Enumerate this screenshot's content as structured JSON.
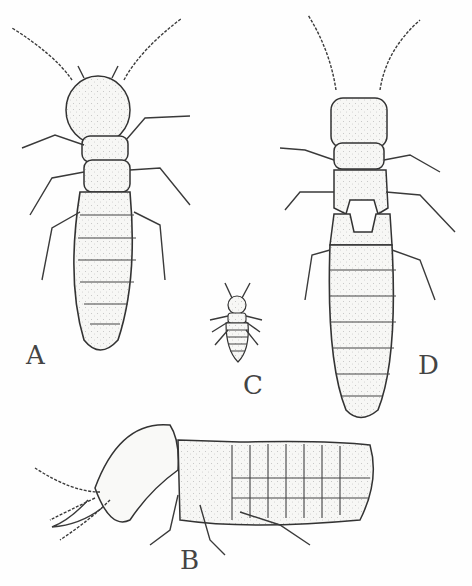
{
  "figure": {
    "labels": {
      "A": "A",
      "B": "B",
      "C": "C",
      "D": "D"
    },
    "specimens": [
      {
        "id": "A",
        "view": "dorsal",
        "note": "worker, dorsal view"
      },
      {
        "id": "B",
        "view": "lateral",
        "note": "soldier with mandibles, side view"
      },
      {
        "id": "C",
        "view": "dorsal",
        "note": "small nymph"
      },
      {
        "id": "D",
        "view": "dorsal",
        "note": "nymph with wing pads"
      }
    ]
  }
}
